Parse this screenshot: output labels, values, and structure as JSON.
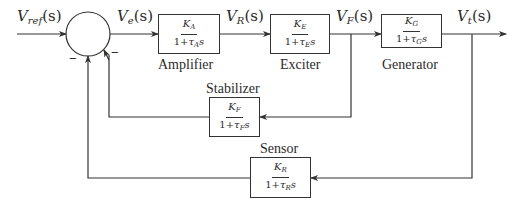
{
  "diagram": {
    "type": "block-diagram",
    "title": "",
    "signals": {
      "input": {
        "main": "V",
        "sub": "ref",
        "arg": "(s)"
      },
      "error": {
        "main": "V",
        "sub": "e",
        "arg": "(s)"
      },
      "amplifier_out": {
        "main": "V",
        "sub": "R",
        "arg": "(s)"
      },
      "exciter_out": {
        "main": "V",
        "sub": "F",
        "arg": "(s)"
      },
      "output": {
        "main": "V",
        "sub": "t",
        "arg": "(s)"
      }
    },
    "summing_junction": {
      "signs": {
        "feedback_sensor": "−",
        "feedback_stabilizer": "−"
      }
    },
    "blocks": {
      "amplifier": {
        "label": "Amplifier",
        "num_main": "K",
        "num_sub": "A",
        "den_one": "1+",
        "den_tau": "τ",
        "den_sub": "A",
        "den_s": "s"
      },
      "exciter": {
        "label": "Exciter",
        "num_main": "K",
        "num_sub": "E",
        "den_one": "1+",
        "den_tau": "τ",
        "den_sub": "E",
        "den_s": "s"
      },
      "generator": {
        "label": "Generator",
        "num_main": "K",
        "num_sub": "G",
        "den_one": "1+",
        "den_tau": "τ",
        "den_sub": "G",
        "den_s": "s"
      },
      "stabilizer": {
        "label": "Stabilizer",
        "num_main": "K",
        "num_sub": "F",
        "den_one": "1+",
        "den_tau": "τ",
        "den_sub": "F",
        "den_s": "s"
      },
      "sensor": {
        "label": "Sensor",
        "num_main": "K",
        "num_sub": "R",
        "den_one": "1+",
        "den_tau": "τ",
        "den_sub": "R",
        "den_s": "s"
      }
    },
    "edges": [
      {
        "from": "input",
        "to": "summing_junction"
      },
      {
        "from": "summing_junction",
        "to": "amplifier",
        "signal": "V_e(s)"
      },
      {
        "from": "amplifier",
        "to": "exciter",
        "signal": "V_R(s)"
      },
      {
        "from": "exciter",
        "to": "generator",
        "signal": "V_F(s)"
      },
      {
        "from": "generator",
        "to": "output",
        "signal": "V_t(s)"
      },
      {
        "from": "exciter_out",
        "to": "stabilizer"
      },
      {
        "from": "stabilizer",
        "to": "summing_junction",
        "sign": "−"
      },
      {
        "from": "output",
        "to": "sensor"
      },
      {
        "from": "sensor",
        "to": "summing_junction",
        "sign": "−"
      }
    ]
  }
}
